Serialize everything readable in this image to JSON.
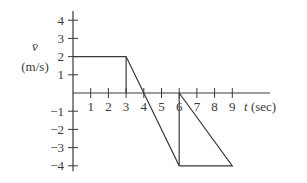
{
  "chart_data": {
    "type": "line",
    "title": "",
    "xlabel": "t (sec)",
    "xlabel_var": "t",
    "xlabel_unit": "(sec)",
    "ylabel": "v̄ (m/s)",
    "ylabel_var": "v̄",
    "ylabel_unit": "(m/s)",
    "xlim": [
      0,
      9
    ],
    "ylim": [
      -4,
      4
    ],
    "x_ticks": [
      1,
      2,
      3,
      4,
      5,
      6,
      7,
      8,
      9
    ],
    "y_ticks": [
      4,
      3,
      2,
      1,
      -1,
      -2,
      -3,
      -4
    ],
    "x_tick_labels": [
      "1",
      "2",
      "3",
      "4",
      "5",
      "6",
      "7",
      "8",
      "9"
    ],
    "y_tick_labels": [
      "4",
      "3",
      "2",
      "1",
      "−1",
      "−2",
      "−3",
      "−4"
    ],
    "grid": false,
    "series": [
      {
        "name": "velocity",
        "x": [
          0,
          3,
          6,
          9,
          6
        ],
        "y": [
          2,
          2,
          -4,
          -4,
          0
        ]
      }
    ],
    "vertical_lines": [
      {
        "x": 3,
        "y_from": 0,
        "y_to": 2
      },
      {
        "x": 6,
        "y_from": 0,
        "y_to": -4
      }
    ]
  }
}
